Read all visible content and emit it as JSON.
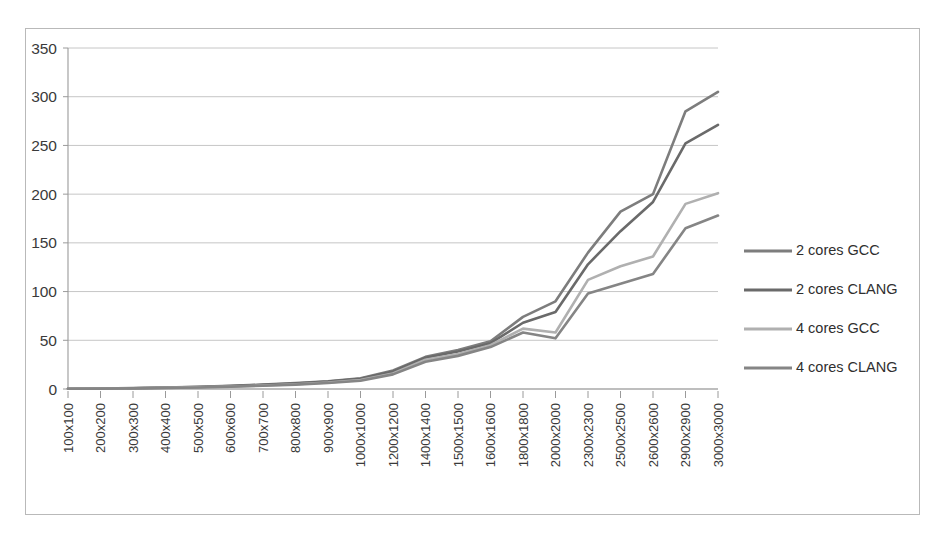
{
  "chart_data": {
    "type": "line",
    "title": "",
    "xlabel": "",
    "ylabel": "",
    "ylim": [
      0,
      350
    ],
    "ytick_step": 50,
    "yticks": [
      "0",
      "50",
      "100",
      "150",
      "200",
      "250",
      "300",
      "350"
    ],
    "grid": true,
    "legend_position": "right",
    "categories": [
      "100x100",
      "200x200",
      "300x300",
      "400x400",
      "500x500",
      "600x600",
      "700x700",
      "800x800",
      "900x900",
      "1000x1000",
      "1200x1200",
      "1400x1400",
      "1500x1500",
      "1600x1600",
      "1800x1800",
      "2000x2000",
      "2300x2300",
      "2500x2500",
      "2600x2600",
      "2900x2900",
      "3000x3000"
    ],
    "series": [
      {
        "name": "2 cores GCC",
        "color": "#7d7d7d",
        "values": [
          0.3,
          0.5,
          0.9,
          1.5,
          2.2,
          3.2,
          4.5,
          6.0,
          8.0,
          11.0,
          19.0,
          33.0,
          40.0,
          49.0,
          74.0,
          90.0,
          140.0,
          182.0,
          200.0,
          285.0,
          305.0
        ]
      },
      {
        "name": "2 cores CLANG",
        "color": "#6a6a6a",
        "values": [
          0.3,
          0.5,
          0.8,
          1.4,
          2.1,
          3.0,
          4.2,
          5.7,
          7.6,
          10.5,
          18.0,
          32.0,
          38.5,
          47.0,
          68.0,
          79.0,
          128.0,
          162.0,
          192.0,
          252.0,
          271.0
        ]
      },
      {
        "name": "4 cores GCC",
        "color": "#b0b0b0",
        "values": [
          0.2,
          0.4,
          0.7,
          1.2,
          1.8,
          2.6,
          3.6,
          4.9,
          6.6,
          9.2,
          16.0,
          30.0,
          36.0,
          45.0,
          62.0,
          58.0,
          112.0,
          126.0,
          136.0,
          190.0,
          201.0
        ]
      },
      {
        "name": "4 cores CLANG",
        "color": "#858585",
        "values": [
          0.2,
          0.4,
          0.6,
          1.1,
          1.6,
          2.4,
          3.3,
          4.5,
          6.1,
          8.5,
          15.0,
          28.0,
          34.0,
          43.0,
          58.0,
          52.0,
          98.0,
          108.0,
          118.0,
          165.0,
          178.0
        ]
      }
    ]
  }
}
